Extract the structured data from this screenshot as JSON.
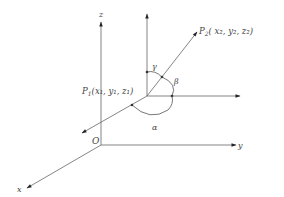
{
  "diagram": {
    "type": "3d-direction-angles",
    "origin_label": "O",
    "axes": {
      "x": "x",
      "y": "y",
      "z": "z"
    },
    "points": {
      "p1": {
        "name": "P",
        "sub": "1",
        "coords": "(x₁, y₁, z₁)"
      },
      "p2": {
        "name": "P",
        "sub": "2",
        "coords": "( x₂, y₂, z₂)"
      }
    },
    "angles": {
      "alpha": "α",
      "beta": "β",
      "gamma": "γ"
    },
    "colors": {
      "line": "#666666",
      "text": "#444444",
      "background": "#ffffff"
    }
  }
}
